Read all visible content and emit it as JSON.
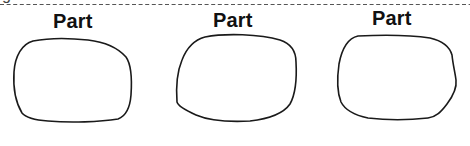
{
  "diagram": {
    "header_fragment": "g",
    "separator": {
      "style": "dashed",
      "color": "#555555"
    },
    "parts": [
      {
        "label": "Part",
        "shape": "irregular-rounded-outline"
      },
      {
        "label": "Part",
        "shape": "irregular-rounded-outline"
      },
      {
        "label": "Part",
        "shape": "irregular-rounded-outline"
      }
    ],
    "stroke_color": "#1a1a1a",
    "text_color": "#111111"
  }
}
